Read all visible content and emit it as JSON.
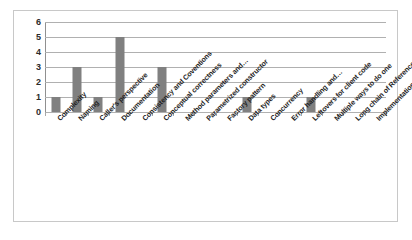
{
  "chart_data": {
    "type": "bar",
    "title": "",
    "subtitle": "",
    "xlabel": "",
    "ylabel": "",
    "ylim": [
      0,
      6
    ],
    "y_ticks": [
      0,
      1,
      2,
      3,
      4,
      5,
      6
    ],
    "grid": true,
    "legend": false,
    "legend_position": "none",
    "orientation": "vertical",
    "bar_color": "#808080",
    "gridline_color": "#b0b0b0",
    "border_color": "#c8c8c8",
    "categories": [
      "Complexity",
      "Naming",
      "Caller's perspective",
      "Documentation",
      "Consistency and Coventions",
      "Conceptual correctness",
      "Method parameters and…",
      "Parametrized constructor",
      "Factory pattern",
      "Data types",
      "Concurrency",
      "Error handling and…",
      "Leftovers for client code",
      "Multiple ways to do one",
      "Long chain of References",
      "Implementation vs. Interface"
    ],
    "values": [
      1,
      3,
      1,
      5,
      0,
      3,
      0,
      0,
      0,
      1,
      0,
      0,
      1,
      0,
      0,
      0
    ]
  }
}
